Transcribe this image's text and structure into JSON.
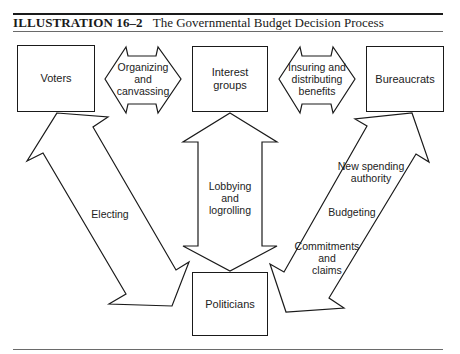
{
  "caption": {
    "label": "ILLUSTRATION 16–2",
    "title": "The Governmental Budget Decision Process"
  },
  "nodes": {
    "voters": "Voters",
    "interest_groups_line1": "Interest",
    "interest_groups_line2": "groups",
    "bureaucrats": "Bureaucrats",
    "politicians": "Politicians"
  },
  "arrows": {
    "organizing": [
      "Organizing",
      "and",
      "canvassing"
    ],
    "insuring": [
      "Insuring and",
      "distributing",
      "benefits"
    ],
    "electing": "Electing",
    "lobbying": [
      "Lobbying",
      "and",
      "logrolling"
    ],
    "new_spending": [
      "New spending",
      "authority"
    ],
    "budgeting": "Budgeting",
    "commitments": [
      "Commitments",
      "and",
      "claims"
    ]
  },
  "colors": {
    "stroke": "#1a1a1a",
    "text": "#222222",
    "background": "#ffffff"
  }
}
